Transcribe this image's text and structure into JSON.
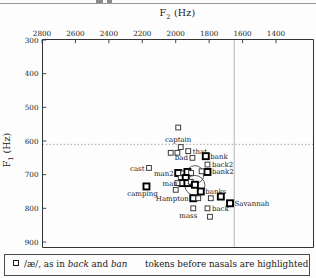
{
  "axes": {
    "x": {
      "title_main": "F",
      "title_sub": "2",
      "title_unit": " (Hz)"
    },
    "y": {
      "title_main": "F",
      "title_sub": "1",
      "title_unit": " (Hz)"
    }
  },
  "legend": {
    "marker": "open-square",
    "left_prefix": "/æ/, as in ",
    "word1": "back",
    "mid": " and ",
    "word2": "ban",
    "right": "tokens before nasals are highlighted"
  },
  "chart_data": {
    "type": "scatter",
    "title": "",
    "xlabel": "F2 (Hz)",
    "ylabel": "F1 (Hz)",
    "x_ticks": [
      2800,
      2600,
      2400,
      2200,
      2000,
      1800,
      1600,
      1400
    ],
    "y_ticks": [
      300,
      400,
      500,
      600,
      700,
      800,
      900
    ],
    "x_reversed": true,
    "y_increases_downward": true,
    "x_range_displayed": [
      2800,
      1200
    ],
    "y_range_displayed": [
      297,
      915
    ],
    "grid": false,
    "reference_lines": {
      "vertical_solid_f2": 1650,
      "horizontal_dotted_f1": 610
    },
    "mean_circles": [
      {
        "f2": 1885,
        "f1": 700,
        "radius_px": 9
      },
      {
        "f2": 1885,
        "f1": 732,
        "radius_px": 10
      }
    ],
    "points": [
      {
        "label": "captain",
        "f2": 1985,
        "f1": 560,
        "highlighted": false,
        "label_pos": "below",
        "label_dy": 14
      },
      {
        "label": null,
        "f2": 2030,
        "f1": 635,
        "highlighted": false
      },
      {
        "label": null,
        "f2": 1990,
        "f1": 635,
        "highlighted": false
      },
      {
        "label": null,
        "f2": 1970,
        "f1": 618,
        "highlighted": false
      },
      {
        "label": "that",
        "f2": 1925,
        "f1": 630,
        "highlighted": false,
        "label_pos": "right"
      },
      {
        "label": "bad",
        "f2": 1900,
        "f1": 650,
        "highlighted": false,
        "label_pos": "left"
      },
      {
        "label": "bank",
        "f2": 1820,
        "f1": 645,
        "highlighted": true,
        "label_pos": "right"
      },
      {
        "label": "back2",
        "f2": 1810,
        "f1": 670,
        "highlighted": false,
        "label_pos": "right"
      },
      {
        "label": "bank2",
        "f2": 1810,
        "f1": 692,
        "highlighted": true,
        "label_pos": "right"
      },
      {
        "label": null,
        "f2": 1845,
        "f1": 690,
        "highlighted": false
      },
      {
        "label": "cast",
        "f2": 2160,
        "f1": 680,
        "highlighted": false,
        "label_pos": "left"
      },
      {
        "label": "man2",
        "f2": 1985,
        "f1": 695,
        "highlighted": true,
        "label_pos": "left"
      },
      {
        "label": null,
        "f2": 1955,
        "f1": 696,
        "highlighted": false
      },
      {
        "label": null,
        "f2": 1930,
        "f1": 692,
        "highlighted": true
      },
      {
        "label": null,
        "f2": 1908,
        "f1": 695,
        "highlighted": false
      },
      {
        "label": null,
        "f2": 1970,
        "f1": 710,
        "highlighted": false
      },
      {
        "label": null,
        "f2": 1940,
        "f1": 710,
        "highlighted": true
      },
      {
        "label": "man",
        "f2": 1960,
        "f1": 725,
        "highlighted": true,
        "label_pos": "left"
      },
      {
        "label": null,
        "f2": 1990,
        "f1": 725,
        "highlighted": false
      },
      {
        "label": null,
        "f2": 1930,
        "f1": 725,
        "highlighted": true
      },
      {
        "label": null,
        "f2": 1910,
        "f1": 721,
        "highlighted": false
      },
      {
        "label": null,
        "f2": 1885,
        "f1": 730,
        "highlighted": true
      },
      {
        "label": "camping",
        "f2": 2175,
        "f1": 735,
        "highlighted": true,
        "label_pos": "below",
        "label_dx": -4
      },
      {
        "label": null,
        "f2": 2000,
        "f1": 745,
        "highlighted": false
      },
      {
        "label": "Hampton",
        "f2": 1895,
        "f1": 770,
        "highlighted": true,
        "label_pos": "left"
      },
      {
        "label": null,
        "f2": 1865,
        "f1": 770,
        "highlighted": false
      },
      {
        "label": "banks",
        "f2": 1850,
        "f1": 750,
        "highlighted": true,
        "label_pos": "right"
      },
      {
        "label": null,
        "f2": 1730,
        "f1": 765,
        "highlighted": true
      },
      {
        "label": null,
        "f2": 1790,
        "f1": 770,
        "highlighted": false
      },
      {
        "label": "Savannah",
        "f2": 1675,
        "f1": 785,
        "highlighted": true,
        "label_pos": "right"
      },
      {
        "label": "back",
        "f2": 1810,
        "f1": 800,
        "highlighted": false,
        "label_pos": "right"
      },
      {
        "label": "mass",
        "f2": 1895,
        "f1": 800,
        "highlighted": false,
        "label_pos": "below",
        "label_dx": -5
      },
      {
        "label": null,
        "f2": 1795,
        "f1": 825,
        "highlighted": false
      }
    ]
  }
}
